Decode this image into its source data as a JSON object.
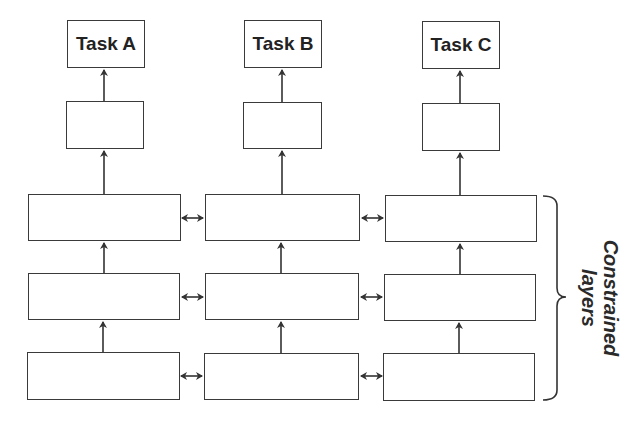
{
  "diagram": {
    "type": "multi-task network with constrained shared layers",
    "tasks": [
      {
        "label": "Task A"
      },
      {
        "label": "Task B"
      },
      {
        "label": "Task C"
      }
    ],
    "columns": 3,
    "constrained_layer_rows": 3,
    "bracket_label": {
      "line1": "Constrained",
      "line2": "layers"
    },
    "colors": {
      "stroke": "#3a3a3a",
      "background": "#ffffff",
      "text": "#222222"
    }
  }
}
